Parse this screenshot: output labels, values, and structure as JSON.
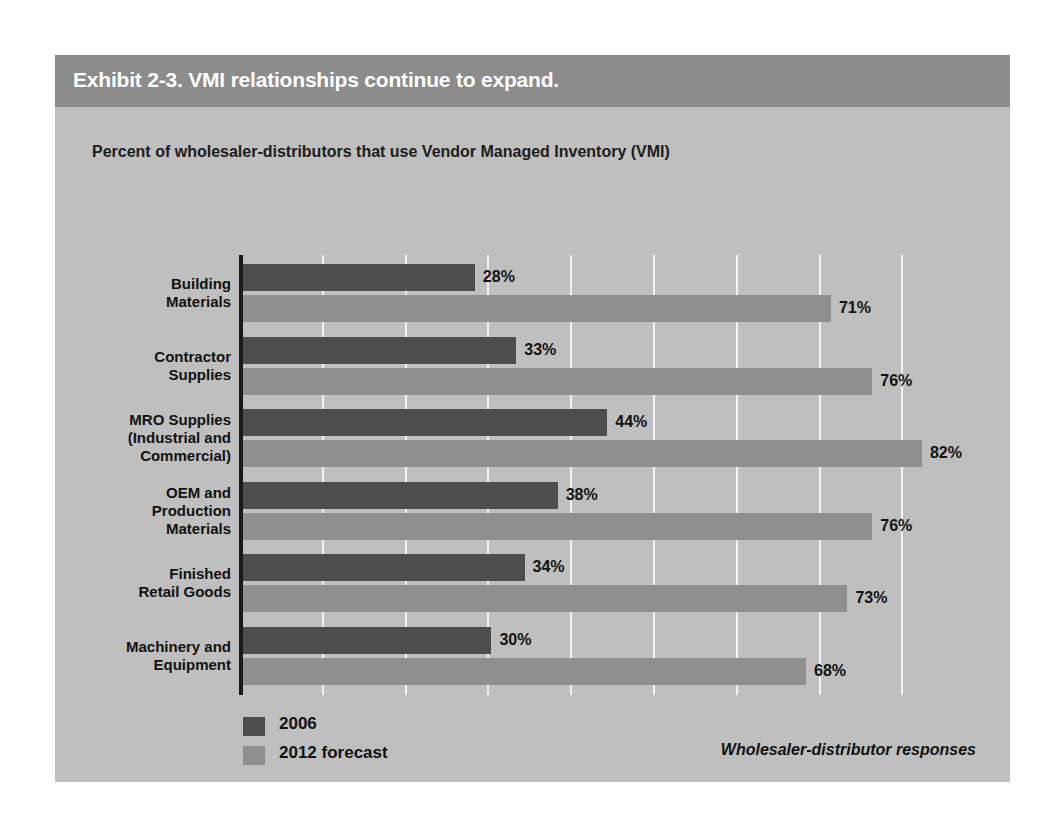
{
  "exhibit": {
    "title": "Exhibit 2-3. VMI relationships continue to expand.",
    "subtitle": "Percent of wholesaler-distributors that use Vendor Managed Inventory (VMI)",
    "source_note": "Wholesaler-distributor responses",
    "colors": {
      "title_bar": "#8c8c8c",
      "panel": "#bfbfbf",
      "series_2006": "#4d4d4d",
      "series_2012": "#8f8f8f",
      "gridline": "#f2f2f2",
      "axis": "#1a1a1a"
    }
  },
  "legend": {
    "items": [
      {
        "label": "2006",
        "color": "#4d4d4d"
      },
      {
        "label": "2012 forecast",
        "color": "#8f8f8f"
      }
    ]
  },
  "chart_data": {
    "type": "bar",
    "orientation": "horizontal",
    "title": "Exhibit 2-3. VMI relationships continue to expand.",
    "subtitle": "Percent of wholesaler-distributors that use Vendor Managed Inventory (VMI)",
    "xlabel": "",
    "ylabel": "",
    "xlim": [
      0,
      90
    ],
    "grid": true,
    "gridlines": [
      10,
      20,
      30,
      40,
      50,
      60,
      70,
      80
    ],
    "legend_position": "bottom-left",
    "categories": [
      "Building\nMaterials",
      "Contractor\nSupplies",
      "MRO Supplies\n(Industrial and\nCommercial)",
      "OEM and\nProduction\nMaterials",
      "Finished\nRetail Goods",
      "Machinery and\nEquipment"
    ],
    "category_lines": [
      [
        "Building",
        "Materials"
      ],
      [
        "Contractor",
        "Supplies"
      ],
      [
        "MRO Supplies",
        "(Industrial and",
        "Commercial)"
      ],
      [
        "OEM and",
        "Production",
        "Materials"
      ],
      [
        "Finished",
        "Retail Goods"
      ],
      [
        "Machinery and",
        "Equipment"
      ]
    ],
    "series": [
      {
        "name": "2006",
        "color": "#4d4d4d",
        "values": [
          28,
          33,
          44,
          38,
          34,
          30
        ],
        "labels": [
          "28%",
          "33%",
          "44%",
          "38%",
          "34%",
          "30%"
        ]
      },
      {
        "name": "2012 forecast",
        "color": "#8f8f8f",
        "values": [
          71,
          76,
          82,
          76,
          73,
          68
        ],
        "labels": [
          "71%",
          "76%",
          "82%",
          "76%",
          "73%",
          "68%"
        ]
      }
    ],
    "units": "percent"
  }
}
